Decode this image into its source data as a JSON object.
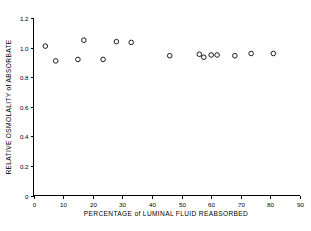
{
  "chart_data": {
    "type": "scatter",
    "title": "",
    "xlabel": "PERCENTAGE of LUMINAL FLUID REABSORBED",
    "ylabel": "RELATIVE OSMOLALITY of ABSORBATE",
    "xlim": [
      0,
      90
    ],
    "ylim": [
      0,
      1.2
    ],
    "xticks": [
      0,
      10,
      20,
      30,
      40,
      50,
      60,
      70,
      80,
      90
    ],
    "xtick_labels": [
      "0",
      "10",
      "20",
      "30",
      "40",
      "50",
      "60",
      "70",
      "80",
      "90"
    ],
    "yticks": [
      0,
      0.2,
      0.4,
      0.6,
      0.8,
      1.0,
      1.2
    ],
    "ytick_labels": [
      "0",
      "0.2",
      "0.4",
      "0.6",
      "0.8",
      "1.0",
      "1.2"
    ],
    "grid": false,
    "legend": null,
    "marker": "open-circle",
    "marker_color": "#1a1a1a",
    "n_points": 15,
    "x": [
      4.0,
      7.5,
      15.0,
      17.0,
      23.5,
      28.0,
      33.0,
      46.0,
      56.0,
      57.5,
      60.0,
      62.0,
      68.0,
      73.5,
      81.0
    ],
    "y": [
      1.01,
      0.91,
      0.92,
      1.05,
      0.92,
      1.04,
      1.035,
      0.945,
      0.955,
      0.935,
      0.95,
      0.95,
      0.945,
      0.96,
      0.96
    ],
    "points": [
      {
        "x": 4.0,
        "y": 1.01
      },
      {
        "x": 7.5,
        "y": 0.91
      },
      {
        "x": 15.0,
        "y": 0.92
      },
      {
        "x": 17.0,
        "y": 1.05
      },
      {
        "x": 23.5,
        "y": 0.92
      },
      {
        "x": 28.0,
        "y": 1.04
      },
      {
        "x": 33.0,
        "y": 1.035
      },
      {
        "x": 46.0,
        "y": 0.945
      },
      {
        "x": 56.0,
        "y": 0.955
      },
      {
        "x": 57.5,
        "y": 0.935
      },
      {
        "x": 60.0,
        "y": 0.95
      },
      {
        "x": 62.0,
        "y": 0.95
      },
      {
        "x": 68.0,
        "y": 0.945
      },
      {
        "x": 73.5,
        "y": 0.96
      },
      {
        "x": 81.0,
        "y": 0.96
      }
    ]
  }
}
